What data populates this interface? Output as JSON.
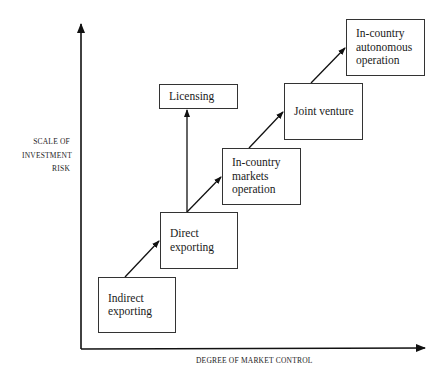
{
  "diagram": {
    "y_axis_label": "SCALE OF\nINVESTMENT\nRISK",
    "x_axis_label": "DEGREE OF MARKET CONTROL",
    "nodes": [
      {
        "id": "indirect",
        "label": "Indirect\nexporting"
      },
      {
        "id": "direct",
        "label": "Direct\nexporting"
      },
      {
        "id": "licensing",
        "label": "Licensing"
      },
      {
        "id": "markets",
        "label": "In-country\nmarkets\noperation"
      },
      {
        "id": "joint",
        "label": "Joint venture"
      },
      {
        "id": "autonomous",
        "label": "In-country\nautonomous\noperation"
      }
    ],
    "edges": [
      {
        "from": "indirect",
        "to": "direct"
      },
      {
        "from": "direct",
        "to": "licensing"
      },
      {
        "from": "direct",
        "to": "markets"
      },
      {
        "from": "markets",
        "to": "joint"
      },
      {
        "from": "joint",
        "to": "autonomous"
      }
    ]
  }
}
